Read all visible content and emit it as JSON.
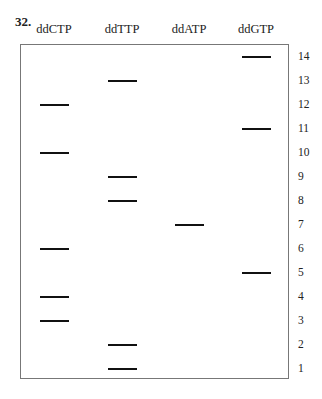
{
  "question_number": "32.",
  "lanes": [
    {
      "label": "ddCTP",
      "bands": [
        12,
        10,
        6,
        4,
        3
      ]
    },
    {
      "label": "ddTTP",
      "bands": [
        13,
        9,
        8,
        2,
        1
      ]
    },
    {
      "label": "ddATP",
      "bands": [
        7
      ]
    },
    {
      "label": "ddGTP",
      "bands": [
        14,
        11,
        5
      ]
    }
  ],
  "row_labels": [
    "14",
    "13",
    "12",
    "11",
    "10",
    "9",
    "8",
    "7",
    "6",
    "5",
    "4",
    "3",
    "2",
    "1"
  ]
}
